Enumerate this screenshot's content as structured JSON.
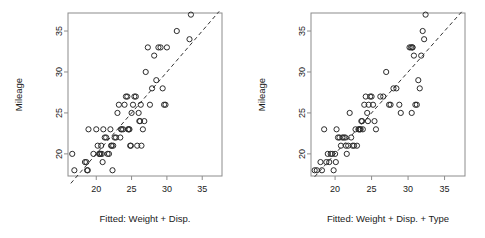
{
  "figure": {
    "title": "",
    "background": "#ffffff",
    "panel_count": 2
  },
  "chart_data": [
    {
      "type": "scatter",
      "panel": "left",
      "title": "",
      "xlabel": "Fitted: Weight + Disp.",
      "ylabel": "Mileage",
      "xlim": [
        16.0,
        37.8
      ],
      "ylim": [
        17.3,
        37.2
      ],
      "xticks": [
        20,
        25,
        30,
        35
      ],
      "yticks": [
        20,
        25,
        30,
        35
      ],
      "xtick_labels": [
        "20",
        "25",
        "30",
        "35"
      ],
      "ytick_labels": [
        "20",
        "25",
        "30",
        "35"
      ],
      "grid": false,
      "legend": null,
      "marker": "open-circle",
      "marker_color": "#2b2b2b",
      "reference_line": {
        "type": "identity",
        "style": "dashed",
        "from": [
          16.4,
          16.4
        ],
        "to": [
          37.4,
          37.4
        ],
        "color": "#333333"
      },
      "x": [
        16.6,
        16.9,
        18.4,
        18.6,
        18.7,
        18.8,
        18.9,
        19.6,
        20.0,
        20.2,
        20.4,
        20.5,
        20.6,
        20.7,
        20.8,
        20.9,
        21.0,
        21.2,
        21.4,
        21.6,
        21.8,
        22.0,
        22.1,
        22.2,
        22.3,
        22.4,
        22.6,
        22.8,
        23.0,
        23.2,
        23.4,
        23.5,
        23.6,
        23.8,
        24.0,
        24.2,
        24.4,
        24.5,
        24.6,
        24.7,
        24.8,
        24.9,
        25.0,
        25.2,
        25.4,
        25.6,
        25.8,
        26.0,
        26.1,
        26.2,
        26.3,
        26.4,
        26.6,
        26.8,
        27.0,
        27.3,
        27.6,
        27.9,
        28.2,
        28.5,
        28.8,
        29.1,
        29.4,
        29.6,
        29.8,
        30.0,
        31.4,
        33.2,
        33.4
      ],
      "y": [
        20.0,
        18.0,
        19.0,
        19.0,
        18.0,
        18.0,
        23.0,
        20.0,
        23.0,
        21.0,
        20.0,
        20.0,
        20.0,
        21.0,
        20.0,
        19.0,
        23.0,
        22.0,
        22.0,
        20.0,
        20.0,
        23.0,
        21.0,
        21.0,
        18.0,
        21.0,
        22.0,
        22.0,
        25.0,
        26.0,
        22.0,
        23.0,
        23.0,
        23.0,
        26.0,
        27.0,
        27.0,
        23.0,
        23.0,
        23.0,
        21.0,
        21.0,
        25.0,
        26.0,
        27.0,
        27.0,
        21.0,
        25.0,
        24.0,
        24.0,
        26.0,
        21.0,
        23.0,
        24.0,
        30.0,
        33.0,
        26.0,
        28.0,
        32.0,
        29.0,
        33.0,
        33.0,
        28.0,
        26.0,
        26.0,
        33.0,
        35.0,
        34.0,
        37.0
      ]
    },
    {
      "type": "scatter",
      "panel": "right",
      "title": "",
      "xlabel": "Fitted: Weight + Disp. + Type",
      "ylabel": "Mileage",
      "xlim": [
        16.7,
        37.8
      ],
      "ylim": [
        17.3,
        37.2
      ],
      "xticks": [
        20,
        25,
        30,
        35
      ],
      "yticks": [
        20,
        25,
        30,
        35
      ],
      "xtick_labels": [
        "20",
        "25",
        "30",
        "35"
      ],
      "ytick_labels": [
        "20",
        "25",
        "30",
        "35"
      ],
      "grid": false,
      "legend": null,
      "marker": "open-circle",
      "marker_color": "#2b2b2b",
      "reference_line": {
        "type": "identity",
        "style": "dashed",
        "from": [
          17.2,
          17.2
        ],
        "to": [
          37.4,
          37.4
        ],
        "color": "#333333"
      },
      "x": [
        17.2,
        17.5,
        18.0,
        18.2,
        18.5,
        18.8,
        19.0,
        19.2,
        19.4,
        19.6,
        19.8,
        20.0,
        20.1,
        20.2,
        20.4,
        20.6,
        20.8,
        21.0,
        21.2,
        21.4,
        21.5,
        21.6,
        21.8,
        22.0,
        22.2,
        22.4,
        22.6,
        22.8,
        23.0,
        23.2,
        23.4,
        23.5,
        23.6,
        23.7,
        23.8,
        24.0,
        24.2,
        24.4,
        24.5,
        24.6,
        24.8,
        25.0,
        25.2,
        25.4,
        25.6,
        26.2,
        26.6,
        27.0,
        27.4,
        27.6,
        28.0,
        28.4,
        28.8,
        29.0,
        30.2,
        30.4,
        30.6,
        30.8,
        31.0,
        31.2,
        31.4,
        31.6,
        31.8,
        32.0,
        32.2,
        32.4,
        30.5,
        30.6,
        23.3
      ],
      "y": [
        18.0,
        18.0,
        19.0,
        18.0,
        23.0,
        19.0,
        20.0,
        19.0,
        20.0,
        20.0,
        18.0,
        20.0,
        19.0,
        23.0,
        22.0,
        22.0,
        21.0,
        22.0,
        22.0,
        22.0,
        21.0,
        20.0,
        21.0,
        25.0,
        22.0,
        21.0,
        21.0,
        23.0,
        21.0,
        23.0,
        23.0,
        23.0,
        24.0,
        24.0,
        23.0,
        26.0,
        27.0,
        25.0,
        24.0,
        26.0,
        27.0,
        27.0,
        26.0,
        24.0,
        23.0,
        27.0,
        27.0,
        30.0,
        26.0,
        26.0,
        28.0,
        28.0,
        26.0,
        25.0,
        33.0,
        33.0,
        33.0,
        32.0,
        26.0,
        26.0,
        29.0,
        28.0,
        32.0,
        35.0,
        34.0,
        37.0,
        25.0,
        33.0,
        23.0
      ]
    }
  ]
}
